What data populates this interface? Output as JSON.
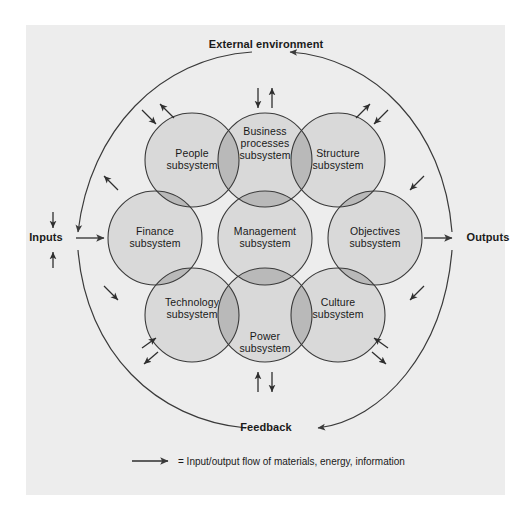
{
  "figure": {
    "colors": {
      "panel_background": "#ededed",
      "circle_fill": "#d9d9d9",
      "overlap_fill": "#b9b9b9",
      "stroke": "#3a3a3a",
      "text": "#1a1a1a"
    }
  },
  "outer_labels": {
    "external_environment": "External environment",
    "inputs": "Inputs",
    "outputs": "Outputs",
    "feedback": "Feedback"
  },
  "subsystems": [
    {
      "id": "business-processes",
      "label": "Business\nprocesses\nsubsystem",
      "cx": 265,
      "cy": 160,
      "r": 47
    },
    {
      "id": "people",
      "label": "People\nsubsystem",
      "cx": 192,
      "cy": 160,
      "r": 47
    },
    {
      "id": "structure",
      "label": "Structure\nsubsystem",
      "cx": 338,
      "cy": 160,
      "r": 47
    },
    {
      "id": "finance",
      "label": "Finance\nsubsystem",
      "cx": 155,
      "cy": 238,
      "r": 47
    },
    {
      "id": "management",
      "label": "Management\nsubsystem",
      "cx": 265,
      "cy": 238,
      "r": 47
    },
    {
      "id": "objectives",
      "label": "Objectives\nsubsystem",
      "cx": 375,
      "cy": 238,
      "r": 47
    },
    {
      "id": "technology",
      "label": "Technology\nsubsystem",
      "cx": 192,
      "cy": 315,
      "r": 47
    },
    {
      "id": "power",
      "label": "Power\nsubsystem",
      "cx": 265,
      "cy": 315,
      "r": 47
    },
    {
      "id": "culture",
      "label": "Culture\nsubsystem",
      "cx": 338,
      "cy": 315,
      "r": 47
    }
  ],
  "legend": {
    "arrow_symbol": "arrow-right-icon",
    "text": "= Input/output flow of materials, energy, information"
  }
}
